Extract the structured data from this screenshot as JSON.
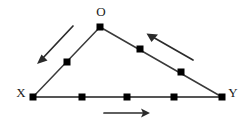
{
  "figure": {
    "background_color": "#ffffff",
    "line_color": "#333333",
    "point_color": "#000000",
    "label_color": "#1a1a1a",
    "arrow_color": "#2b2b2b",
    "width": 248,
    "height": 130,
    "vertices": [
      {
        "name": "O",
        "label": "O",
        "x": 100,
        "y": 27,
        "label_x": 101,
        "label_y": 13
      },
      {
        "name": "X",
        "label": "X",
        "x": 33,
        "y": 97,
        "label_x": 21,
        "label_y": 94
      },
      {
        "name": "Y",
        "label": "Y",
        "x": 222,
        "y": 97,
        "label_x": 233,
        "label_y": 94
      }
    ],
    "edges": [
      {
        "name": "edge-x-o",
        "from": "X",
        "to": "O",
        "x1": 33,
        "y1": 97,
        "x2": 100,
        "y2": 27
      },
      {
        "name": "edge-o-y",
        "from": "O",
        "to": "Y",
        "x1": 100,
        "y1": 27,
        "x2": 222,
        "y2": 97
      },
      {
        "name": "edge-x-y",
        "from": "X",
        "to": "Y",
        "x1": 33,
        "y1": 97,
        "x2": 222,
        "y2": 97
      }
    ],
    "marked_points": [
      {
        "name": "point-left-edge-1",
        "edge": "edge-x-o",
        "x": 67,
        "y": 62
      },
      {
        "name": "point-right-edge-1",
        "edge": "edge-o-y",
        "x": 140,
        "y": 49
      },
      {
        "name": "point-right-edge-2",
        "edge": "edge-o-y",
        "x": 181,
        "y": 72
      },
      {
        "name": "point-base-1",
        "edge": "edge-x-y",
        "x": 82,
        "y": 97
      },
      {
        "name": "point-base-2",
        "edge": "edge-x-y",
        "x": 127,
        "y": 97
      },
      {
        "name": "point-base-3",
        "edge": "edge-x-y",
        "x": 174,
        "y": 97
      }
    ],
    "arrows": [
      {
        "name": "arrow-left-downward",
        "direction": "down-left",
        "tail_x": 73,
        "tail_y": 26,
        "head_x": 38,
        "head_y": 63
      },
      {
        "name": "arrow-right-upward",
        "direction": "up-left",
        "tail_x": 193,
        "tail_y": 60,
        "head_x": 147,
        "head_y": 34
      },
      {
        "name": "arrow-base-rightward",
        "direction": "right",
        "tail_x": 104,
        "tail_y": 113,
        "head_x": 150,
        "head_y": 113
      }
    ]
  }
}
